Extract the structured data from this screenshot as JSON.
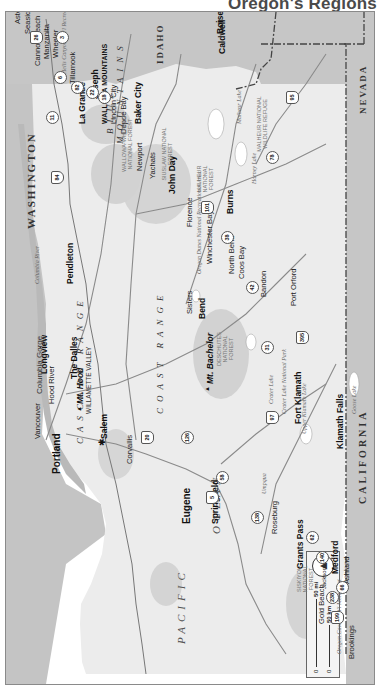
{
  "title": "Oregon's Regions",
  "scale": {
    "miles_label": "50 mi",
    "km_label": "50 km",
    "zero_label": "0",
    "compass": "north-arrow"
  },
  "states": {
    "washington": "WASHINGTON",
    "idaho": "IDAHO",
    "nevada": "NEVADA",
    "california": "CALIFORNIA"
  },
  "ocean": {
    "pacific": "PACIFIC",
    "ocean": "OCEAN"
  },
  "ranges": {
    "coast": "COAST RANGE",
    "cascade": "CASCADE RANGE",
    "cascade2": "CASCADE",
    "blue": "BLUE",
    "mountains": "MOUNTAINS",
    "wallowa": "WALLOWA MOUNTAINS",
    "range_word": "RANGE",
    "coast_word": "COAST"
  },
  "regions": {
    "willamette": "WILLAMETTE VALLEY",
    "columbia_gorge": "Columbia Gorge"
  },
  "cities": {
    "astoria": "Astoria",
    "seaside": "Seaside",
    "cannon_beach": "Cannon Beach",
    "manzanita": "Manzanita",
    "wheeler": "Wheeler",
    "tillamook": "Tillamook",
    "lincoln_city": "Lincoln City",
    "depoe_bay": "Depoe Bay",
    "newport": "Newport",
    "yachats": "Yachats",
    "florence": "Florence",
    "winchester_bay": "Winchester Bay",
    "north_bend": "North Bend",
    "coos_bay": "Coos Bay",
    "bandon": "Bandon",
    "port_orford": "Port Orford",
    "gold_beach": "Gold Beach",
    "brookings": "Brookings",
    "longview": "Longview",
    "vancouver": "Vancouver",
    "portland": "Portland",
    "salem": "Salem",
    "corvallis": "Corvallis",
    "eugene": "Eugene",
    "springfield": "Springfield",
    "roseburg": "Roseburg",
    "grants_pass": "Grants Pass",
    "jacksonville": "Jacksonville",
    "medford": "Medford",
    "ashland": "Ashland",
    "klamath_falls": "Klamath Falls",
    "fort_klamath": "Fort Klamath",
    "bend": "Bend",
    "sisters": "Sisters",
    "hood_river": "Hood River",
    "the_dalles": "The Dalles",
    "pendleton": "Pendleton",
    "la_grande": "La Grande",
    "joseph": "Joseph",
    "baker_city": "Baker City",
    "john_day": "John Day",
    "burns": "Burns",
    "caldwell": "Caldwell",
    "boise": "Boise"
  },
  "peaks": {
    "mt_hood": "Mt. Hood",
    "mt_bachelor": "Mt. Bachelor"
  },
  "forests": {
    "siuslaw": "SIUSLAW NATIONAL FOREST",
    "siskiyou": "SISKIYOU NATIONAL FOREST",
    "deschutes": "DESCHUTES NATIONAL FOREST",
    "malheur": "MALHEUR NATIONAL FOREST",
    "wallowa_whitman": "WALLOWA-WHITMAN NATIONAL FOREST",
    "malheur_refuge": "MALHEUR NATIONAL WILDLIFE REFUGE",
    "crater_lake_np": "Crater Lake National Park",
    "oregon_dunes": "Oregon Dunes National Recreational Area",
    "oregon_caves": "Oregon Caves Nat'l Monument",
    "hells_canyon": "Hells Canyon Nat'l Recreation Area"
  },
  "water": {
    "columbia_river": "Columbia River",
    "crater_lake": "Crater Lake",
    "upper_klamath": "Upper Klamath Lake",
    "malheur_lake": "Malheur Lake",
    "harney_lake": "Harney Lake",
    "goose_lake": "Goose Lake",
    "umpqua": "Umpqua",
    "rogue": "Rogue River",
    "willamette_river": "Willamette River",
    "mckenzie": "McKenzie River"
  },
  "highways": [
    "26",
    "6",
    "22",
    "18",
    "20",
    "101",
    "38",
    "42",
    "126",
    "5",
    "58",
    "138",
    "62",
    "140",
    "66",
    "238",
    "199",
    "97",
    "31",
    "395",
    "20",
    "78",
    "95",
    "84",
    "82",
    "3",
    "11",
    "26",
    "140",
    "95"
  ],
  "colors": {
    "land": "#e9e9e9",
    "water": "#b4b4b4",
    "outside": "#c9c9c9",
    "forest": "#d2d2d2",
    "border": "#555555"
  }
}
